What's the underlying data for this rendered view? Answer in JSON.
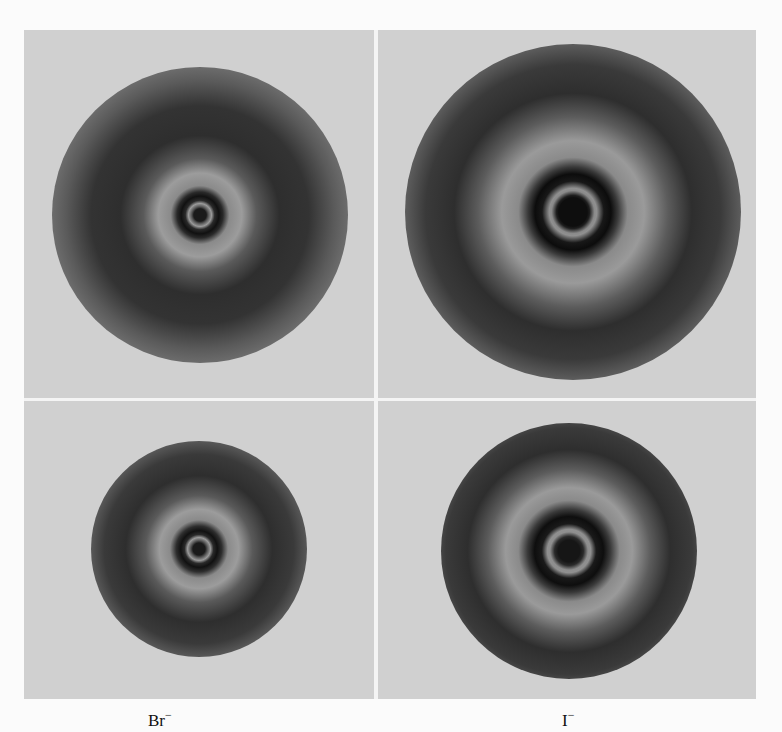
{
  "figure": {
    "panels": [
      {
        "id": "top-left",
        "ion": "Br-",
        "center": [
          176,
          185
        ],
        "outer_radius": 148
      },
      {
        "id": "top-right",
        "ion": "I-",
        "center": [
          195,
          182
        ],
        "outer_radius": 168
      },
      {
        "id": "bottom-left",
        "ion": "Br-",
        "center": [
          175,
          148
        ],
        "outer_radius": 108
      },
      {
        "id": "bottom-right",
        "ion": "I-",
        "center": [
          191,
          150
        ],
        "outer_radius": 128
      }
    ],
    "captions": {
      "left": "Br",
      "left_sup": "−",
      "right": "I",
      "right_sup": "−"
    }
  }
}
